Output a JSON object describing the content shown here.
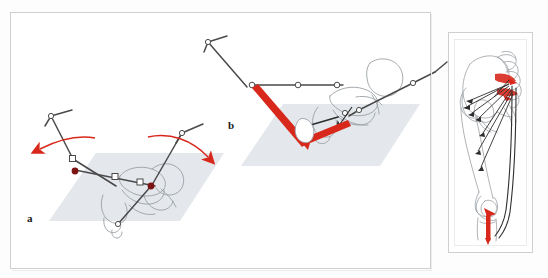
{
  "figure": {
    "type": "anatomical-biomechanical-diagram",
    "background_color": "#fdfdfd",
    "frame_color": "#cfcfcf",
    "panels": [
      {
        "id": "a",
        "label": "a",
        "description": "Stick-figure skeletal model of pelvis and both legs in frontal-oblique view with curved red rotation arrows indicating pelvic rotation about the hip joints",
        "markers": "two dark-red filled hip joint centres",
        "arrows": 2,
        "arrow_color": "#d8281c"
      },
      {
        "id": "b",
        "label": "b",
        "description": "Stick-figure skeletal model of pelvis and legs seen from a different orientation with thick red force vectors along the left thigh and shank",
        "markers": "open circle joint centres",
        "arrows": 0,
        "vector_color": "#d8281c"
      }
    ],
    "inset": {
      "id": "inset-leg",
      "description": "Anatomical line drawing of pelvis, sacrum, lumbar vertebrae, femur and tibia with black muscle line-of-action vectors converging on the sacrum and a red muscle highlight at the sacroiliac region and at the proximal tibia",
      "highlight_color": "#d8281c",
      "line_color": "#3a3a3a",
      "bone_outline_color": "#8e9499"
    },
    "colors": {
      "red": "#d8281c",
      "dark_red": "#7d1414",
      "bone_line": "#9aa0a5",
      "segment_line": "#4a4a4a",
      "ground_plane": "#dfe3e8",
      "frame": "#cfcfcf"
    },
    "ground_planes": [
      {
        "panel": "a",
        "fill": "#dfe3e8"
      },
      {
        "panel": "b",
        "fill": "#dfe3e8"
      }
    ]
  }
}
